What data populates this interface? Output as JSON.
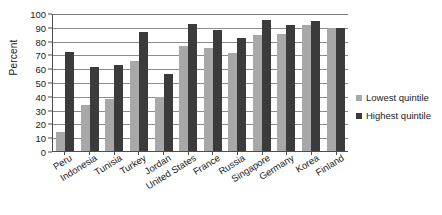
{
  "chart_data": {
    "type": "bar",
    "title": "",
    "xlabel": "",
    "ylabel": "Percent",
    "ylim": [
      0,
      100
    ],
    "ytick_step": 10,
    "grid": true,
    "legend_position": "right",
    "categories": [
      "Peru",
      "Indonesia",
      "Tunisia",
      "Turkey",
      "Jordan",
      "United States",
      "France",
      "Russia",
      "Singapore",
      "Germany",
      "Korea",
      "Finland"
    ],
    "ytick_labels": [
      "100",
      "90",
      "80",
      "70",
      "60",
      "50",
      "40",
      "30",
      "20",
      "10",
      "0"
    ],
    "series": [
      {
        "name": "Lowest quintile",
        "color": "#a8a8a8",
        "values": [
          14,
          33,
          38,
          65,
          39,
          76,
          75,
          71,
          84,
          85,
          91,
          89
        ]
      },
      {
        "name": "Highest quintile",
        "color": "#3b3b3b",
        "values": [
          72,
          61,
          62,
          86,
          56,
          92,
          88,
          82,
          95,
          91,
          94,
          89
        ]
      }
    ]
  },
  "legend": {
    "items": [
      {
        "label": "Lowest quintile",
        "color": "#a8a8a8"
      },
      {
        "label": "Highest quintile",
        "color": "#3b3b3b"
      }
    ]
  }
}
